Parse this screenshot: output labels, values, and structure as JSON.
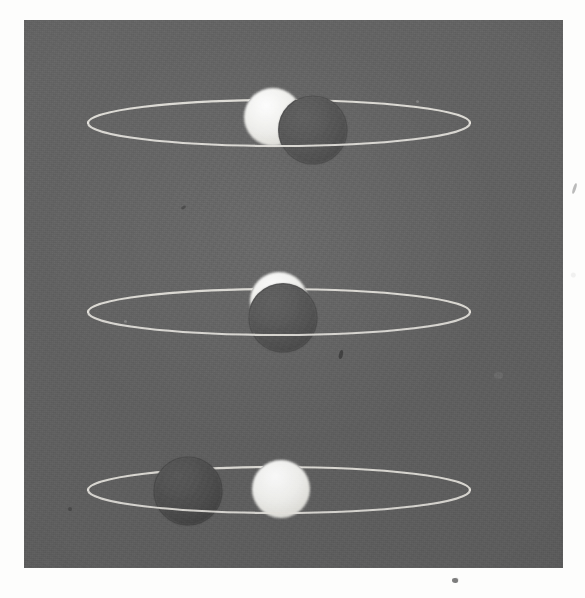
{
  "photograph": {
    "medium": "black-and-white photographic print of a three-dimensional teaching model",
    "subject_description": "Three stacked elliptical orbit rings, each carrying one illuminated white sphere and one shaded dark sphere, demonstrating successive phase/eclipse alignments",
    "print_background_color": "#5f5f5f",
    "paper_color": "#fdfdfc",
    "orbit_wire_color": "#e8e6e0",
    "lit_sphere_color": "#efefec",
    "shaded_sphere_color": "#4d4d4d",
    "plate_bounds": {
      "left": 24,
      "top": 20,
      "width": 539,
      "height": 548
    }
  },
  "chart_data": {
    "type": "scatter",
    "title": "",
    "subtitle": "",
    "xlabel": "",
    "ylabel": "",
    "grid": false,
    "legend_position": "none",
    "xlim": [
      0,
      539
    ],
    "ylim": [
      0,
      548
    ],
    "annotations": [],
    "orbits": [
      {
        "name": "upper-orbit",
        "center_x": 255,
        "center_y": 103,
        "semi_major_axis": 191,
        "semi_minor_axis": 23,
        "stroke_color": "#e8e6e0",
        "stroke_width": 2.2,
        "bodies": [
          {
            "name": "lit-sphere-upper",
            "label": "illuminated sphere",
            "cx": 249,
            "cy": 97,
            "r": 29,
            "fill": "#efefec",
            "z": 1,
            "phase_note": "right side occluded by shaded sphere, leaving a thick waxing crescent"
          },
          {
            "name": "shaded-sphere-upper",
            "label": "shaded sphere",
            "cx": 289,
            "cy": 110,
            "r": 34,
            "fill": "#4d4d4d",
            "z": 2,
            "phase_note": "in front of and to the right of the illuminated sphere"
          }
        ]
      },
      {
        "name": "middle-orbit",
        "center_x": 255,
        "center_y": 292,
        "semi_major_axis": 191,
        "semi_minor_axis": 23,
        "stroke_color": "#e8e6e0",
        "stroke_width": 2.2,
        "bodies": [
          {
            "name": "lit-sphere-middle",
            "label": "illuminated sphere",
            "cx": 255,
            "cy": 281,
            "r": 29,
            "fill": "#efefec",
            "z": 1,
            "phase_note": "almost entirely hidden; only a thin crescent shows above the shaded sphere"
          },
          {
            "name": "shaded-sphere-middle",
            "label": "shaded sphere",
            "cx": 259,
            "cy": 298,
            "r": 34,
            "fill": "#4d4d4d",
            "z": 2,
            "phase_note": "directly in front of the illuminated sphere, centred on the orbit"
          }
        ]
      },
      {
        "name": "lower-orbit",
        "center_x": 255,
        "center_y": 470,
        "semi_major_axis": 191,
        "semi_minor_axis": 23,
        "stroke_color": "#e8e6e0",
        "stroke_width": 2.2,
        "bodies": [
          {
            "name": "shaded-sphere-lower",
            "label": "shaded sphere",
            "cx": 164,
            "cy": 471,
            "r": 34,
            "fill": "#4d4d4d",
            "z": 1,
            "phase_note": "well to the left, fully separated from the illuminated sphere"
          },
          {
            "name": "lit-sphere-lower",
            "label": "illuminated sphere",
            "cx": 257,
            "cy": 469,
            "r": 29,
            "fill": "#efefec",
            "z": 2,
            "phase_note": "fully visible, unobstructed full disc"
          }
        ]
      }
    ]
  }
}
